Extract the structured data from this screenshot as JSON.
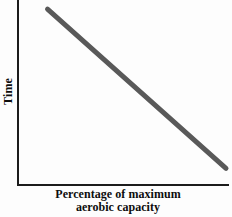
{
  "figure": {
    "background_color": "#fdfdfd",
    "axis_color": "#1c1c1c",
    "series_color": "#595959"
  },
  "axes": {
    "y_title": "Time",
    "x_title_line1": "Percentage of maximum",
    "x_title_line2": "aerobic capacity"
  },
  "chart_data": {
    "type": "line",
    "title": "",
    "subtitle": "",
    "xlabel": "Percentage of maximum aerobic capacity",
    "ylabel": "Time",
    "xlim": [
      0,
      100
    ],
    "ylim": [
      0,
      100
    ],
    "grid": false,
    "legend": null,
    "legend_position": "none",
    "xticks": [],
    "yticks": [],
    "xticklabels": [],
    "yticklabels": [],
    "annotations": [],
    "series": [
      {
        "name": "Time to exhaustion",
        "color": "#595959",
        "linewidth": 5,
        "x": [
          8,
          100
        ],
        "y": [
          97,
          5
        ]
      }
    ]
  }
}
